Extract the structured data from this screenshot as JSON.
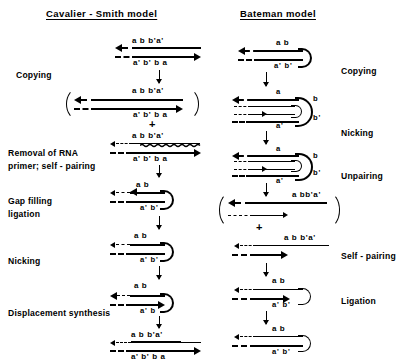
{
  "figure": {
    "type": "diagram",
    "columns": [
      {
        "id": "cavalier-smith",
        "title": "Cavalier - Smith  model",
        "steps": [
          {
            "label": "Copying"
          },
          {
            "label": "Removal of  RNA"
          },
          {
            "label": "primer;  self - pairing"
          },
          {
            "label": "Gap  filling"
          },
          {
            "label": "ligation"
          },
          {
            "label": "Nicking"
          },
          {
            "label": "Displacement  synthesis"
          }
        ],
        "sequences": [
          "a b b'a'",
          "a' b' b a",
          "a b b'a'",
          "a' b' b a",
          "a b b'a'",
          "a' b' b a",
          "a b",
          "a' b'",
          "a  b",
          "a' b'",
          "a  b",
          "a' b",
          "a  b  b'a'",
          "a' b' b a"
        ],
        "plus_sign": "+"
      },
      {
        "id": "bateman",
        "title": "Bateman model",
        "steps": [
          {
            "label": "Copying"
          },
          {
            "label": "Nicking"
          },
          {
            "label": "Unpairing"
          },
          {
            "label": "Self - pairing"
          },
          {
            "label": "Ligation"
          }
        ],
        "sequences": [
          "a b",
          "a' b'",
          "a",
          "b",
          "b'",
          "a'",
          "a",
          "b",
          "b'",
          "a'",
          "a bb'a'",
          "a  b  b'a'",
          "a   b",
          "a' b'",
          "a   b",
          "a' b'"
        ],
        "plus_sign": "+"
      }
    ],
    "colors": {
      "ink": "#000000",
      "background": "#ffffff"
    }
  }
}
